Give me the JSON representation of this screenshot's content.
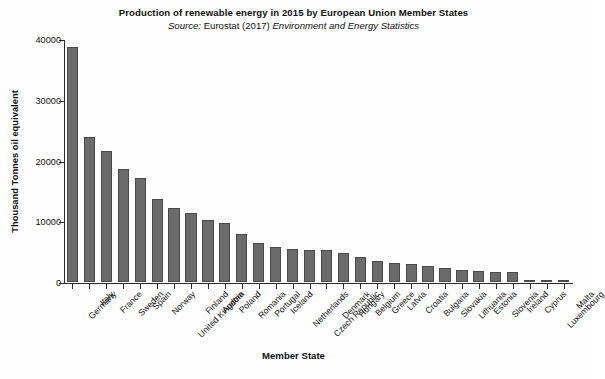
{
  "chart_data": {
    "type": "bar",
    "title": "Production of renewable energy in 2015 by European Union Member States",
    "subtitle_source_word": "Source:",
    "subtitle_source_name": "Eurostat (2017)",
    "subtitle_publication": "Environment and Energy Statistics",
    "xlabel": "Member State",
    "ylabel": "Thousand Tonnes oil equivalent",
    "ylim": [
      0,
      40000
    ],
    "yticks": [
      0,
      10000,
      20000,
      30000,
      40000
    ],
    "ytick_labels": [
      "0",
      "10000",
      "20000",
      "30000",
      "40000"
    ],
    "grid": false,
    "legend": false,
    "bar_color": "#6b6b6b",
    "bar_edge_color": "#4a4a4a",
    "axis_color": "#2b2b2b",
    "categories": [
      "Germany",
      "Italy",
      "France",
      "Sweden",
      "Spain",
      "Norway",
      "United Kingdom",
      "Finland",
      "Austria",
      "Poland",
      "Romania",
      "Portugal",
      "Iceland",
      "Netherlands",
      "Czech Republic",
      "Denmark",
      "Hungary",
      "Belgium",
      "Greece",
      "Latvia",
      "Croatia",
      "Bulgaria",
      "Slovakia",
      "Lithuania",
      "Estonia",
      "Slovenia",
      "Ireland",
      "Cyprus",
      "Luxembourg",
      "Malta"
    ],
    "values": [
      38700,
      23800,
      21600,
      18600,
      17100,
      13700,
      12200,
      11300,
      10200,
      9700,
      7900,
      6400,
      5700,
      5500,
      5300,
      5200,
      4700,
      4200,
      3500,
      3100,
      2900,
      2600,
      2300,
      2000,
      1800,
      1700,
      1600,
      200,
      150,
      90
    ]
  }
}
